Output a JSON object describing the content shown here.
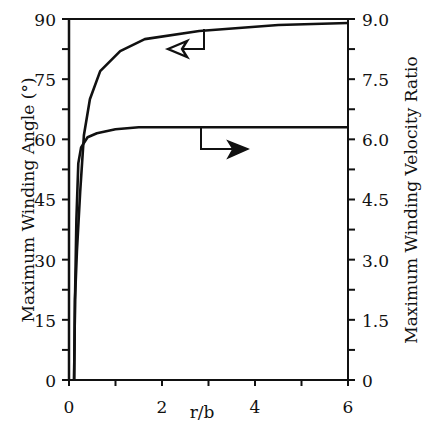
{
  "chart_data": {
    "type": "line",
    "title": "",
    "xlabel": "r/b",
    "ylabel": "Maximum Winding Angle (°)",
    "y2label": "Maximum Winding Velocity Ratio",
    "xlim": [
      0,
      6
    ],
    "ylim": [
      0,
      90
    ],
    "y2lim": [
      0,
      9.0
    ],
    "x_ticks": [
      0,
      2,
      4,
      6
    ],
    "x_minor_ticks": [
      1,
      3,
      5
    ],
    "y_ticks": [
      0,
      15,
      30,
      45,
      60,
      75,
      90
    ],
    "y2_ticks": [
      "0",
      "1.5",
      "3.0",
      "4.5",
      "6.0",
      "7.5",
      "9.0"
    ],
    "grid": false,
    "legend": "none (arrows indicate which axis each curve uses)",
    "series": [
      {
        "name": "Maximum Winding Angle",
        "axis": "left",
        "arrow": "left",
        "x": [
          0.11,
          0.13,
          0.17,
          0.24,
          0.32,
          0.45,
          0.67,
          1.1,
          1.63,
          2.8,
          4.5,
          6.0
        ],
        "values": [
          0,
          20,
          32,
          47,
          61,
          70,
          77,
          82,
          85,
          87,
          88.5,
          89
        ]
      },
      {
        "name": "Maximum Winding Velocity Ratio",
        "axis": "right",
        "arrow": "right",
        "x": [
          0.11,
          0.13,
          0.16,
          0.2,
          0.26,
          0.4,
          0.6,
          1.0,
          1.5,
          2.5,
          4.0,
          6.0
        ],
        "values": [
          0,
          2.0,
          4.0,
          5.4,
          5.8,
          6.05,
          6.15,
          6.25,
          6.3,
          6.3,
          6.3,
          6.3
        ]
      }
    ]
  },
  "labels": {
    "xlabel": "r/b",
    "ylabel": "Maximum Winding Angle (°)",
    "y2label": "Maximum Winding Velocity Ratio",
    "x_ticks": [
      "0",
      "2",
      "4",
      "6"
    ],
    "y_ticks": [
      "0",
      "15",
      "30",
      "45",
      "60",
      "75",
      "90"
    ],
    "y2_ticks": [
      "0",
      "1.5",
      "3.0",
      "4.5",
      "6.0",
      "7.5",
      "9.0"
    ]
  }
}
